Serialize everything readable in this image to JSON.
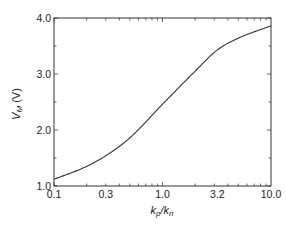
{
  "chart_data": {
    "type": "line",
    "title": "",
    "xlabel": "k_p/k_n",
    "ylabel": "V_M (V)",
    "xscale": "log",
    "xlim": [
      0.1,
      10.0
    ],
    "ylim": [
      1.0,
      4.0
    ],
    "xticks": [
      0.1,
      0.3,
      1.0,
      3.2,
      10.0
    ],
    "xtick_labels": [
      "0.1",
      "0.3",
      "1.0",
      "3.2",
      "10.0"
    ],
    "yticks": [
      1.0,
      2.0,
      3.0,
      4.0
    ],
    "ytick_labels": [
      "1.0",
      "2.0",
      "3.0",
      "4.0"
    ],
    "grid": false,
    "legend": null,
    "series": [
      {
        "name": "V_M",
        "x": [
          0.1,
          0.2,
          0.3,
          0.5,
          1.0,
          2.0,
          3.2,
          5.0,
          10.0
        ],
        "values": [
          1.12,
          1.35,
          1.54,
          1.86,
          2.46,
          3.05,
          3.43,
          3.64,
          3.86
        ]
      }
    ]
  },
  "labels": {
    "x_axis_main": "k",
    "x_axis_sub1": "p",
    "x_axis_mid": "/k",
    "x_axis_sub2": "n",
    "y_axis_main": "V",
    "y_axis_sub": "M",
    "y_axis_unit": " (V)"
  }
}
